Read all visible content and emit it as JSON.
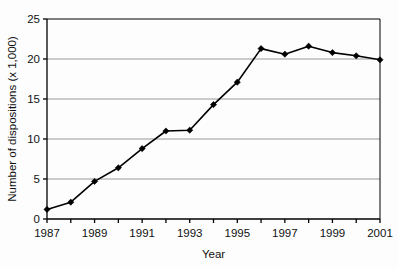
{
  "chart_data": {
    "type": "line",
    "title": "",
    "xlabel": "Year",
    "ylabel": "Number of dispositions (x 1,000)",
    "x": [
      1987,
      1988,
      1989,
      1990,
      1991,
      1992,
      1993,
      1994,
      1995,
      1996,
      1997,
      1998,
      1999,
      2000,
      2001
    ],
    "values": [
      1.2,
      2.1,
      4.7,
      6.4,
      8.8,
      11.0,
      11.1,
      14.3,
      17.1,
      21.3,
      20.6,
      21.6,
      20.8,
      20.4,
      19.9
    ],
    "series": [
      {
        "name": "Number of dispositions",
        "values": [
          1.2,
          2.1,
          4.7,
          6.4,
          8.8,
          11.0,
          11.1,
          14.3,
          17.1,
          21.3,
          20.6,
          21.6,
          20.8,
          20.4,
          19.9
        ]
      }
    ],
    "xlim": [
      1987,
      2001
    ],
    "ylim": [
      0,
      25
    ],
    "ytick_values": [
      0,
      5,
      10,
      15,
      20,
      25
    ],
    "ytick_labels": [
      "0",
      "5",
      "10",
      "15",
      "20",
      "25"
    ],
    "xtick_values": [
      1987,
      1988,
      1989,
      1990,
      1991,
      1992,
      1993,
      1994,
      1995,
      1996,
      1997,
      1998,
      1999,
      2000,
      2001
    ],
    "xtick_labels": [
      "1987",
      "",
      "1989",
      "",
      "1991",
      "",
      "1993",
      "",
      "1995",
      "",
      "1997",
      "",
      "1999",
      "",
      "2001"
    ],
    "grid": "horizontal",
    "legend": "none",
    "marker": "diamond",
    "line_color": "#000000",
    "marker_color": "#000000",
    "grid_color": "#999999",
    "axis_color": "#000000",
    "background_color": "#fdfdfd"
  }
}
